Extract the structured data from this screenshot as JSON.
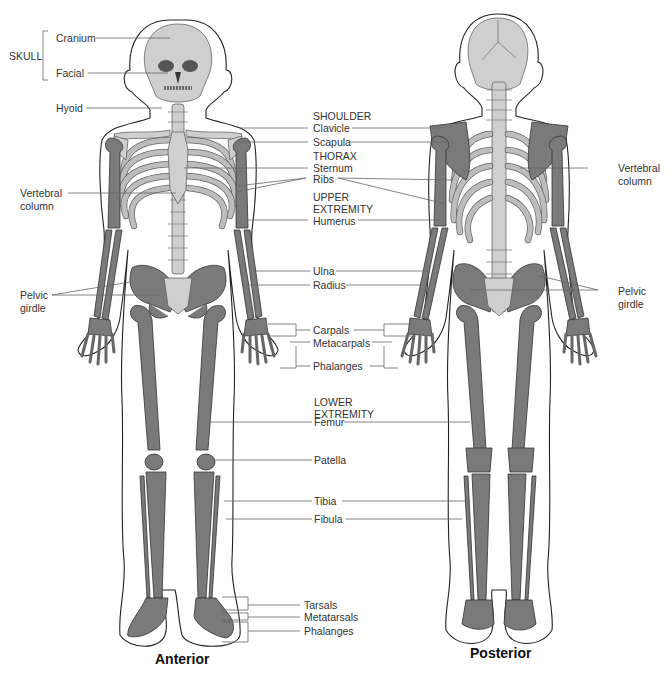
{
  "views": {
    "anterior_caption": "Anterior",
    "posterior_caption": "Posterior"
  },
  "labels": {
    "skull_group": "SKULL",
    "cranium": "Cranium",
    "facial": "Facial",
    "hyoid": "Hyoid",
    "vertebral_column_left_1": "Vertebral",
    "vertebral_column_left_2": "column",
    "pelvic_girdle_left_1": "Pelvic",
    "pelvic_girdle_left_2": "girdle",
    "shoulder_group": "SHOULDER",
    "clavicle": "Clavicle",
    "scapula": "Scapula",
    "thorax_group": "THORAX",
    "sternum": "Sternum",
    "ribs": "Ribs",
    "upper_extremity_1": "UPPER",
    "upper_extremity_2": "EXTREMITY",
    "humerus": "Humerus",
    "ulna": "Ulna",
    "radius": "Radius",
    "carpals": "Carpals",
    "metacarpals": "Metacarpals",
    "phalanges_hand": "Phalanges",
    "lower_extremity_1": "LOWER",
    "lower_extremity_2": "EXTREMITY",
    "femur": "Femur",
    "patella": "Patella",
    "tibia": "Tibia",
    "fibula": "Fibula",
    "tarsals": "Tarsals",
    "metatarsals": "Metatarsals",
    "phalanges_foot": "Phalanges",
    "vertebral_column_right_1": "Vertebral",
    "vertebral_column_right_2": "column",
    "pelvic_girdle_right_1": "Pelvic",
    "pelvic_girdle_right_2": "girdle"
  },
  "colors": {
    "axial_bone": "#cfcfcf",
    "appendicular_bone": "#7a7a7a",
    "outline": "#222222"
  }
}
